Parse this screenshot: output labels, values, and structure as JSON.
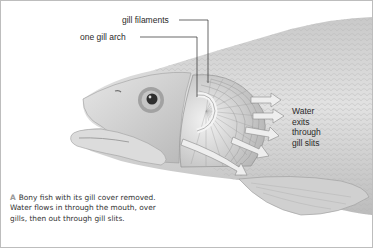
{
  "figure": {
    "labels": {
      "gill_filaments": "gill filaments",
      "one_gill_arch": "one gill arch"
    },
    "exit_label": {
      "lines": [
        "Water",
        "exits",
        "through",
        "gill slits"
      ]
    },
    "caption": {
      "marker": "A",
      "text": "Bony fish with its gill cover removed. Water flows in through the mouth, over gills, then out through gill slits."
    },
    "colors": {
      "border": "#bdbdbd",
      "fish_body": "#d6d6d6",
      "fish_shadow": "#a8a8a8",
      "text": "#2a2a2a",
      "caption_marker": "#9a9a9a"
    }
  }
}
